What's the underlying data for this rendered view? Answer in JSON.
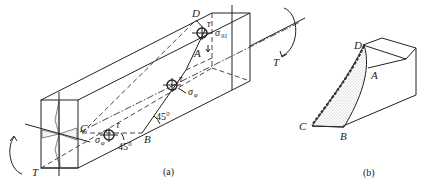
{
  "figure_a": {
    "caption": "(a)",
    "points": {
      "A": "A",
      "B": "B",
      "C": "C",
      "D": "D"
    },
    "torque_left": "T",
    "torque_right": "T",
    "angle_1": "45°",
    "angle_2": "45°",
    "stresses": {
      "tau_top": "τ",
      "sigma_top": "σ",
      "sigma_top_sub": "91",
      "tau_mid": "τ",
      "sigma_mid": "σ",
      "sigma_mid_sub": "φ",
      "tau_bot": "τ",
      "sigma_bot": "σ",
      "sigma_bot_sub": "φ"
    }
  },
  "figure_b": {
    "caption": "(b)",
    "points": {
      "A": "A",
      "B": "B",
      "C": "C",
      "D": "D"
    }
  },
  "colors": {
    "ink": "#222222",
    "background": "#ffffff",
    "stipple": "#777777"
  }
}
